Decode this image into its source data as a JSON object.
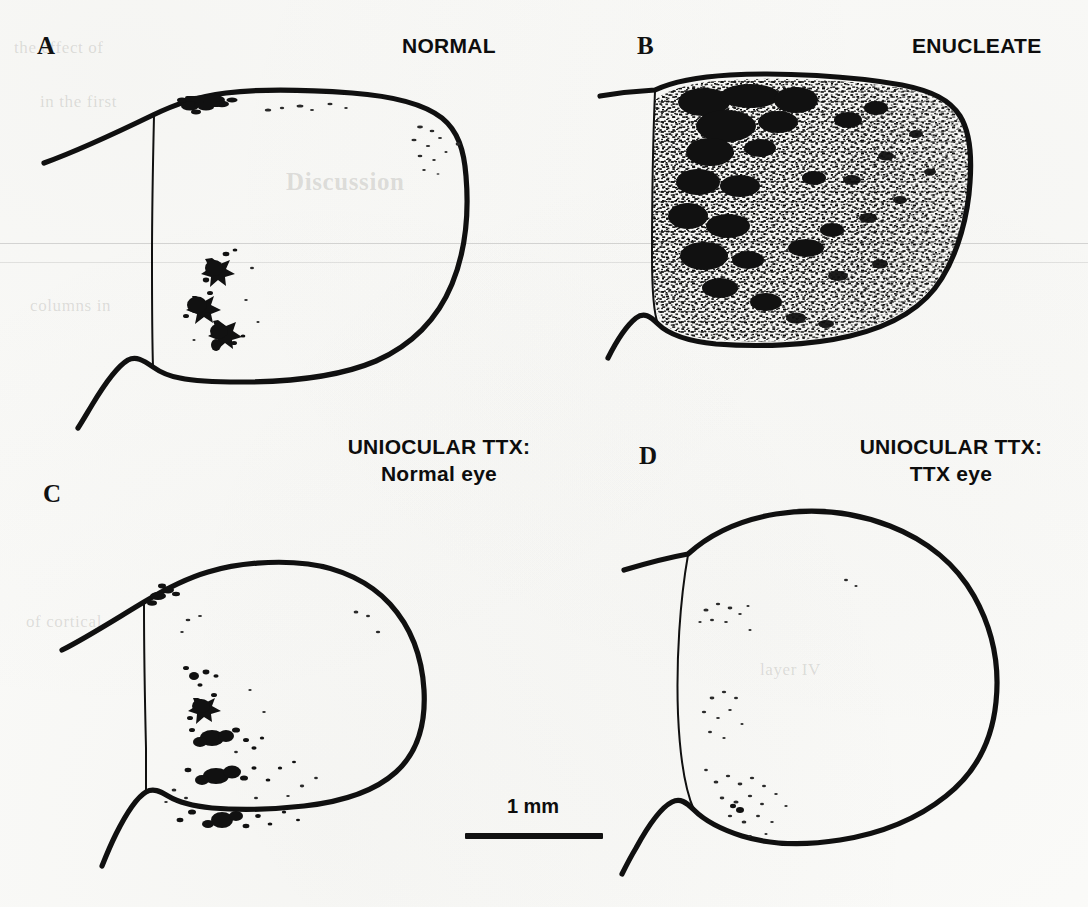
{
  "figure": {
    "kind": "four-panel line-drawing of brain sections with autoradiographic label",
    "background_color": "#fbfbf9",
    "ink_color": "#101010"
  },
  "panels": [
    {
      "id": "A",
      "letter": "A",
      "title": "NORMAL",
      "title_line2": "",
      "description": "sparse label: one dark patch at dorsal edge, three star-shaped clusters mid-section"
    },
    {
      "id": "B",
      "letter": "B",
      "title": "ENUCLEATE",
      "title_line2": "",
      "description": "dense stippling throughout section, darkest blobs on medial (left) half"
    },
    {
      "id": "C",
      "letter": "C",
      "title": "UNIOCULAR TTX:",
      "title_line2": "Normal eye",
      "description": "vertical chain of four to five dark clusters in medial third"
    },
    {
      "id": "D",
      "letter": "D",
      "title": "UNIOCULAR TTX:",
      "title_line2": "TTX eye",
      "description": "very sparse faint dot clusters near medial border"
    }
  ],
  "scale_bar": {
    "label": "1 mm",
    "length_px": 138
  },
  "background_ghost_text": [
    "Discussion",
    "the effect of",
    "in the first",
    "columns in",
    "of cortical",
    "layer IV"
  ]
}
